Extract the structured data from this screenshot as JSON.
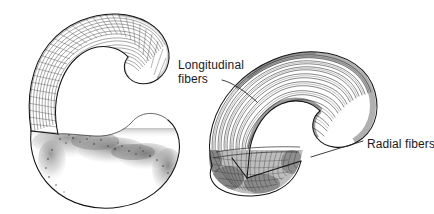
{
  "figure": {
    "background_color": "#ffffff",
    "ink_color": "#141414",
    "width": 434,
    "height": 214
  },
  "panels": [
    {
      "id": "left-panel",
      "name": "cross-hatched-mesh-view",
      "description": "Hook-shaped structure rendered with a fine cross-hatched grid mesh over the upper limb and soft stippled tonal shading over the lower bulbous base",
      "labels": []
    },
    {
      "id": "right-panel",
      "name": "fiber-line-view",
      "description": "Hook-shaped structure rendered with long parallel curved longitudinal fiber lines and a dark hatched radial fiber base",
      "labels": [
        "longitudinal-fibers",
        "radial-fibers"
      ]
    }
  ],
  "annotations": {
    "longitudinal_fibers": {
      "line1": "Longitudinal",
      "line2": "fibers",
      "text_x": 178,
      "text_y1": 69,
      "text_y2": 83,
      "leader_from_x": 228,
      "leader_from_y": 80,
      "leader_to_x": 257,
      "leader_to_y": 102
    },
    "radial_fibers": {
      "line1": "Radial fibers",
      "text_x": 367,
      "text_y1": 148,
      "leader_from_x": 362,
      "leader_from_y": 141,
      "leader_to_x": 311,
      "leader_to_y": 157
    }
  },
  "colors": {
    "ink": "#141414",
    "fiber": "#222222",
    "mesh": "#2e2e2e",
    "leader": "#2a2a2a",
    "label": "#1a1a1a",
    "background": "#ffffff"
  }
}
